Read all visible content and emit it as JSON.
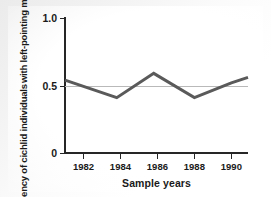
{
  "chart_data": {
    "type": "line",
    "title": "",
    "subtitle": "",
    "xlabel": "Sample years",
    "ylabel_line1": "Frequency of cichlid individuals",
    "ylabel_line2": "with left-pointing mouths",
    "xlim": [
      1981.0,
      1990.9
    ],
    "ylim": [
      0,
      1.0
    ],
    "grid": false,
    "legend": "none",
    "x_ticks": [
      1982,
      1984,
      1986,
      1988,
      1990
    ],
    "x_tick_labels": [
      "1982",
      "1984",
      "1986",
      "1988",
      "1990"
    ],
    "y_ticks": [
      0,
      0.5,
      1.0
    ],
    "y_tick_labels": [
      "0",
      "0.5",
      "1.0"
    ],
    "reference_line": {
      "value": 0.5,
      "orientation": "horizontal",
      "color": "#b9b9b9"
    },
    "series": [
      {
        "name": "Frequency of left-pointing mouths",
        "color": "#5a5a5a",
        "line_width": 3,
        "x": [
          1981.0,
          1983.8,
          1985.8,
          1988.0,
          1990.0,
          1990.9
        ],
        "values": [
          0.54,
          0.41,
          0.59,
          0.41,
          0.52,
          0.56
        ]
      }
    ]
  },
  "axes": {
    "y_tick_0": "0",
    "y_tick_half": "0.5",
    "y_tick_one": "1.0"
  },
  "colors": {
    "series": "#5a5a5a",
    "axis": "#262626",
    "reference": "#b9b9b9",
    "background": "#ffffff",
    "page": "#ededed"
  }
}
